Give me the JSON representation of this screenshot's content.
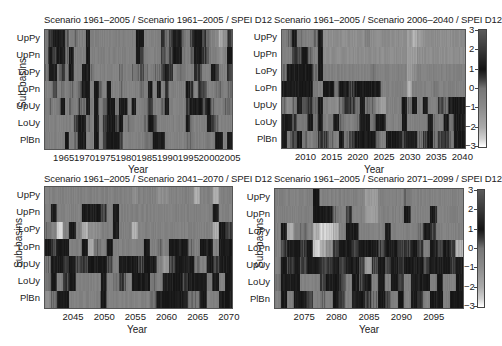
{
  "colorbar": {
    "ticks": [
      "3",
      "2",
      "1",
      "0",
      "−1",
      "−2",
      "−3"
    ],
    "values": [
      3,
      2,
      1,
      0,
      -1,
      -2,
      -3
    ],
    "colormap_stops": [
      {
        "v": 3,
        "color": "#5a5a5a"
      },
      {
        "v": 2,
        "color": "#383838"
      },
      {
        "v": 1,
        "color": "#141414"
      },
      {
        "v": 0.5,
        "color": "#3c3c3c"
      },
      {
        "v": 0,
        "color": "#767676"
      },
      {
        "v": -1,
        "color": "#8c8c8c"
      },
      {
        "v": -2,
        "color": "#aaaaaa"
      },
      {
        "v": -2.6,
        "color": "#d0d0d0"
      },
      {
        "v": -3,
        "color": "#ffffff"
      }
    ]
  },
  "chart_data": [
    {
      "type": "heatmap",
      "title": "Scenario 1961–2005 / Scenario 1961–2005 / SPEI D12",
      "xlabel": "Year",
      "ylabel": "Sub-basins",
      "rows": [
        "UpPy",
        "UpPn",
        "LoPy",
        "LoPn",
        "UpUy",
        "LoUy",
        "PlBn"
      ],
      "x_start": 1961,
      "x_end": 2005,
      "xticks": [
        "1965",
        "1970",
        "1975",
        "1980",
        "1985",
        "1990",
        "1995",
        "2000",
        "2005"
      ],
      "xtick_values": [
        1965,
        1970,
        1975,
        1980,
        1985,
        1990,
        1995,
        2000,
        2005
      ],
      "clim": [
        -3,
        3
      ],
      "values": [
        [
          0,
          0.5,
          1,
          1,
          1,
          0.3,
          -0.5,
          0,
          -0.5,
          -0.5,
          1,
          -0.5,
          -0.5,
          -0.5,
          -0.5,
          -0.5,
          -0.5,
          -0.5,
          -0.5,
          -0.5,
          -0.5,
          -0.5,
          1,
          1,
          -0.5,
          -0.5,
          -0.5,
          -0.5,
          0.5,
          0,
          0.5,
          1,
          1,
          0,
          -0.5,
          0.5,
          1,
          1,
          0.5,
          0,
          -0.5,
          -1,
          -2,
          -1,
          0.5
        ],
        [
          0,
          1,
          0.5,
          1,
          1,
          0,
          1,
          -0.5,
          -0.5,
          -0.5,
          1,
          -0.5,
          -0.5,
          -0.5,
          -0.5,
          -0.5,
          -0.5,
          -0.5,
          -0.5,
          -0.5,
          -0.5,
          -0.5,
          1,
          0.5,
          -0.5,
          -0.5,
          -0.5,
          -0.5,
          0.5,
          0,
          0.5,
          1,
          1,
          0,
          -0.5,
          0.3,
          1,
          1,
          0.5,
          0,
          -0.5,
          -0.5,
          -1,
          -0.5,
          1
        ],
        [
          0,
          1,
          1,
          0,
          0.5,
          0,
          1,
          -0.5,
          -0.5,
          1,
          1,
          0,
          -0.5,
          -0.5,
          -0.5,
          -0.5,
          -0.5,
          -0.5,
          0,
          -0.5,
          -0.5,
          0,
          0,
          0.3,
          0,
          -0.5,
          0,
          0,
          0.5,
          1,
          0.5,
          -0.5,
          0,
          0,
          -0.5,
          -0.5,
          0.5,
          0.5,
          -0.5,
          -0.5,
          1,
          0.5,
          -0.5,
          -0.5,
          0.5
        ],
        [
          -0.5,
          -0.5,
          0.5,
          -0.5,
          0,
          -0.5,
          0,
          -0.5,
          0.3,
          1,
          1,
          -0.5,
          1,
          0,
          -0.5,
          1,
          -0.5,
          -0.5,
          0,
          -0.5,
          -0.5,
          -0.5,
          -0.5,
          0,
          -0.5,
          1,
          -0.5,
          1,
          -0.5,
          0.5,
          -0.5,
          -0.5,
          -0.5,
          -0.5,
          1,
          0.5,
          -0.5,
          0.5,
          0.5,
          -0.5,
          -0.5,
          0,
          0,
          -0.5,
          0
        ],
        [
          -0.5,
          0,
          -0.5,
          0,
          1,
          -0.5,
          0,
          -0.5,
          0.3,
          0,
          1,
          -0.5,
          1,
          -0.5,
          0,
          1,
          1,
          0,
          1,
          1,
          -0.5,
          1,
          -0.5,
          -0.5,
          0,
          0.5,
          -0.5,
          -0.5,
          0,
          1,
          -0.5,
          -0.5,
          -0.5,
          -0.5,
          0.5,
          1,
          1,
          1,
          0.5,
          1,
          0,
          -0.5,
          -0.5,
          0,
          0
        ],
        [
          -0.5,
          -0.5,
          -0.5,
          -0.5,
          -0.5,
          -0.5,
          -0.5,
          0.5,
          1,
          1,
          0,
          -0.5,
          1,
          -0.5,
          0.5,
          1,
          1,
          0.5,
          1,
          -0.5,
          0,
          -0.5,
          -0.5,
          -0.5,
          0,
          1,
          0.5,
          -0.5,
          -0.5,
          -0.5,
          -0.5,
          -0.5,
          -0.5,
          -0.5,
          1,
          0,
          -0.5,
          -0.5,
          -0.5,
          1,
          0.5,
          0,
          -0.5,
          -0.5,
          -0.5
        ],
        [
          -0.5,
          -0.5,
          -0.5,
          -0.5,
          -0.5,
          1,
          -0.5,
          0,
          1,
          1,
          -0.5,
          -0.5,
          1,
          -0.5,
          0.5,
          1,
          1,
          1,
          0.5,
          -0.5,
          -0.5,
          -0.5,
          -0.5,
          -0.5,
          0,
          0,
          1,
          1,
          1,
          -0.5,
          -0.5,
          -0.5,
          -0.5,
          -0.5,
          0,
          0,
          -0.5,
          -0.5,
          -0.5,
          0,
          -0.5,
          1,
          1,
          -0.5,
          1
        ]
      ]
    },
    {
      "type": "heatmap",
      "title": "Scenario 1961–2005 / Scenario 2006–2040 / SPEI D12",
      "xlabel": "Year",
      "ylabel": "Sub-basins",
      "rows": [
        "UpPy",
        "UpPn",
        "LoPy",
        "LoPn",
        "UpUy",
        "LoUy",
        "PlBn"
      ],
      "x_start": 2006,
      "x_end": 2040,
      "xticks": [
        "2010",
        "2015",
        "2020",
        "2025",
        "2030",
        "2035",
        "2040"
      ],
      "xtick_values": [
        2010,
        2015,
        2020,
        2025,
        2030,
        2035,
        2040
      ],
      "clim": [
        -3,
        3
      ],
      "values": [
        [
          -0.5,
          0,
          1,
          0,
          -0.5,
          -0.5,
          0,
          1,
          -1,
          -1,
          -1,
          -1,
          -1,
          -1,
          -1,
          -1,
          -0.5,
          -1,
          -1,
          -1,
          -1,
          -1,
          -1,
          -1,
          -1.5,
          -2,
          -1.5,
          -1,
          -1,
          -1,
          -1,
          -1,
          -1,
          -1,
          -1
        ],
        [
          -0.5,
          -0.5,
          0.5,
          0.5,
          1,
          0,
          -0.5,
          1,
          -1,
          -1,
          -1,
          -1,
          -1,
          -1,
          -1,
          -1,
          -1,
          -1,
          -1,
          -1,
          -1,
          -1,
          -1,
          -1,
          -1.5,
          -1.5,
          -1,
          -1,
          -1,
          -1,
          -1,
          -1,
          -1,
          -1,
          -1
        ],
        [
          0,
          1,
          1,
          1,
          1,
          1,
          0,
          1,
          -0.5,
          -0.5,
          -0.5,
          -0.5,
          -0.5,
          -0.5,
          -0.5,
          -0.5,
          -0.5,
          0,
          -0.5,
          -0.5,
          -0.5,
          -0.5,
          -0.5,
          -0.5,
          -1.5,
          -1,
          -0.5,
          -0.5,
          -0.5,
          -0.5,
          -0.5,
          -0.5,
          -0.5,
          -0.5,
          -0.5
        ],
        [
          1,
          1,
          1,
          1,
          1,
          1,
          0,
          -0.5,
          1,
          1,
          0,
          1,
          1,
          0.5,
          1,
          1,
          1,
          1,
          1,
          -0.5,
          -0.5,
          -0.5,
          -0.5,
          -0.5,
          -2,
          -0.5,
          -0.5,
          -0.5,
          -0.5,
          0,
          -0.5,
          -0.5,
          -0.5,
          -0.5,
          -0.5
        ],
        [
          0,
          -1,
          0,
          1,
          0.5,
          0.5,
          0,
          1,
          -0.5,
          -1,
          -1,
          0,
          0.5,
          0.5,
          0,
          1,
          0,
          0,
          -1,
          -1.5,
          -0.5,
          -0.5,
          -0.5,
          1,
          0,
          1,
          -0.5,
          1,
          -0.5,
          -0.5,
          0.5,
          0,
          1,
          1,
          1
        ],
        [
          1,
          1,
          0.5,
          0,
          0,
          1,
          0,
          1,
          -0.5,
          0,
          1,
          0,
          -0.5,
          -0.5,
          0,
          1,
          1,
          0,
          1,
          1,
          -0.5,
          -0.5,
          -0.5,
          1,
          -0.5,
          -0.5,
          -0.5,
          -0.5,
          1,
          0,
          -0.5,
          1,
          0,
          1,
          1
        ],
        [
          1,
          0,
          0.5,
          1,
          0,
          -0.5,
          0,
          0.5,
          0.5,
          0,
          -0.5,
          1,
          0,
          0.5,
          1,
          1,
          1,
          1,
          0,
          -0.5,
          1,
          1,
          1,
          0.5,
          1,
          1,
          0,
          0.5,
          1,
          0,
          0.5,
          0.5,
          0,
          1,
          1
        ]
      ]
    },
    {
      "type": "heatmap",
      "title": "Scenario 1961–2005 / Scenario 2041–2070 / SPEI D12",
      "xlabel": "Year",
      "ylabel": "Sub-basins",
      "rows": [
        "UpPy",
        "UpPn",
        "LoPy",
        "LoPn",
        "UpUy",
        "LoUy",
        "PlBn"
      ],
      "x_start": 2041,
      "x_end": 2070,
      "xticks": [
        "2045",
        "2050",
        "2055",
        "2060",
        "2065",
        "2070"
      ],
      "xtick_values": [
        2045,
        2050,
        2055,
        2060,
        2065,
        2070
      ],
      "clim": [
        -3,
        3
      ],
      "values": [
        [
          -0.5,
          -0.5,
          -0.5,
          -0.5,
          -0.5,
          -0.5,
          -0.5,
          -0.5,
          -0.5,
          -0.5,
          -0.5,
          -0.5,
          -0.5,
          -0.5,
          -1,
          -0.5,
          -0.5,
          -0.5,
          -1,
          -1,
          -0.5,
          -0.5,
          -0.5,
          -0.5,
          -2,
          -0.5,
          -0.5,
          -2,
          -0.5,
          -0.5
        ],
        [
          -0.5,
          1,
          -0.5,
          -0.5,
          -0.5,
          -0.5,
          1,
          1,
          1,
          0.5,
          -0.5,
          1,
          -0.5,
          -0.5,
          -0.5,
          -0.5,
          -0.5,
          -0.5,
          -0.5,
          -0.5,
          -0.5,
          -0.5,
          -0.5,
          -0.5,
          -0.5,
          -0.5,
          -0.5,
          1,
          -0.5,
          -0.5
        ],
        [
          0,
          -0.5,
          -2.5,
          -0.5,
          1,
          -0.5,
          -2,
          -1,
          -1,
          -0.5,
          -0.5,
          1,
          -0.5,
          -0.5,
          -2,
          -0.5,
          -0.5,
          -0.5,
          -0.5,
          -0.5,
          -0.5,
          -0.5,
          -0.5,
          -0.5,
          -0.5,
          -0.5,
          -0.5,
          -2,
          1,
          0.5
        ],
        [
          1,
          0.5,
          1,
          1,
          -0.5,
          -0.5,
          1,
          -2,
          0,
          -0.5,
          1,
          -0.5,
          -0.5,
          -0.5,
          -0.5,
          -0.5,
          1,
          -0.5,
          0,
          -0.5,
          1,
          1,
          1,
          0,
          -0.5,
          1,
          1,
          -0.5,
          1,
          1
        ],
        [
          0,
          1,
          1,
          0.5,
          1,
          0.5,
          0.5,
          1,
          1,
          1,
          0.5,
          -0.5,
          1,
          1,
          1,
          0.5,
          1,
          1,
          -0.5,
          -1.5,
          0.5,
          1,
          1,
          1,
          0,
          -0.5,
          1,
          0.5,
          1,
          1
        ],
        [
          0,
          1,
          -0.5,
          0.5,
          1,
          -0.5,
          -0.5,
          -0.5,
          -0.5,
          1,
          -0.5,
          0,
          0.5,
          -0.5,
          1,
          1,
          1,
          0,
          -0.5,
          1,
          1,
          1,
          0.5,
          1,
          1,
          1,
          0,
          1,
          -0.5,
          1
        ],
        [
          -1,
          0,
          1,
          1,
          -0.5,
          -0.5,
          -0.5,
          -0.5,
          -0.5,
          1,
          -0.5,
          -0.5,
          -0.5,
          -0.5,
          -0.5,
          -0.5,
          -0.5,
          0,
          1,
          1,
          1,
          1,
          1,
          0,
          0,
          1,
          -0.5,
          -0.5,
          1,
          1
        ]
      ]
    },
    {
      "type": "heatmap",
      "title": "Scenario 1961–2005 / Scenario 2071–2099 / SPEI D12",
      "xlabel": "Year",
      "ylabel": "Sub-basins",
      "rows": [
        "UpPy",
        "UpPn",
        "LoPy",
        "LoPn",
        "UpUy",
        "LoUy",
        "PlBn"
      ],
      "x_start": 2071,
      "x_end": 2099,
      "xticks": [
        "2075",
        "2080",
        "2085",
        "2090",
        "2095"
      ],
      "xtick_values": [
        2075,
        2080,
        2085,
        2090,
        2095
      ],
      "clim": [
        -3,
        3
      ],
      "values": [
        [
          -0.5,
          -0.5,
          -0.5,
          -0.5,
          -0.5,
          -0.5,
          1,
          -0.5,
          -0.5,
          -0.5,
          -0.5,
          -0.5,
          -0.5,
          -0.5,
          -1.5,
          -1.5,
          -0.5,
          -0.5,
          -0.5,
          -0.5,
          0,
          -0.5,
          -0.5,
          -0.5,
          -0.5,
          -0.5,
          -0.5,
          -0.5,
          -0.5
        ],
        [
          -0.5,
          -0.5,
          -0.5,
          -0.5,
          -0.5,
          -0.5,
          1,
          1,
          1,
          0,
          -0.5,
          0.5,
          -0.5,
          -0.5,
          -1.5,
          -1.5,
          -0.5,
          -0.5,
          -0.5,
          -0.5,
          1,
          -0.5,
          -0.5,
          -0.5,
          1,
          -0.5,
          -0.5,
          -0.5,
          -0.5
        ],
        [
          -0.5,
          1,
          -2,
          -0.5,
          0,
          -0.5,
          -2,
          -2.5,
          -2.5,
          -2,
          -0.5,
          1,
          1,
          -0.5,
          -0.5,
          -0.5,
          -0.5,
          1,
          -0.5,
          -0.5,
          -0.5,
          -0.5,
          0,
          1,
          0.5,
          -0.5,
          -0.5,
          -0.5,
          -0.5
        ],
        [
          -0.5,
          0.5,
          1,
          1,
          0.5,
          1,
          -2.5,
          -2,
          -1,
          0.5,
          1,
          1,
          0.5,
          1,
          1,
          1,
          0.5,
          1,
          1,
          0.5,
          0.5,
          1,
          0.5,
          -0.5,
          1,
          0.5,
          1,
          0.5,
          -2
        ],
        [
          -0.5,
          1,
          0.5,
          1,
          0.5,
          1,
          1,
          0.5,
          0.5,
          1,
          0.5,
          1,
          1,
          0.5,
          -1.5,
          0.5,
          1,
          0.5,
          1,
          0.5,
          1,
          1,
          1,
          0.5,
          1,
          1,
          1,
          0.5,
          1
        ],
        [
          0,
          1,
          1,
          1,
          -0.5,
          -0.5,
          -0.5,
          0.5,
          1,
          1,
          0.5,
          -0.5,
          1,
          0.5,
          1,
          -0.5,
          1,
          -0.5,
          1,
          0.5,
          -0.5,
          1,
          1,
          1,
          -0.5,
          1,
          -0.5,
          -0.5,
          1
        ],
        [
          -0.5,
          1,
          -0.5,
          1,
          1,
          0.5,
          -0.5,
          0,
          -0.5,
          1,
          0.5,
          -0.5,
          1,
          1,
          0.5,
          0,
          1,
          0.5,
          -0.5,
          1,
          -0.5,
          1,
          0.5,
          -0.5,
          1,
          1,
          -0.5,
          1,
          1
        ]
      ]
    }
  ]
}
